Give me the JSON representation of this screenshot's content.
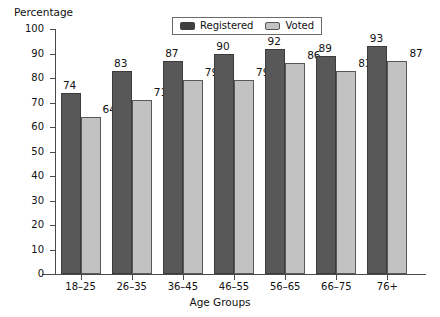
{
  "chart_data": {
    "type": "bar",
    "title": "",
    "xlabel": "Age Groups",
    "ylabel": "Percentage",
    "categories": [
      "18–25",
      "26–35",
      "36–45",
      "46–55",
      "56–65",
      "66–75",
      "76+"
    ],
    "series": [
      {
        "name": "Registered",
        "color": "#585858",
        "values": [
          74,
          83,
          87,
          90,
          92,
          89,
          93
        ]
      },
      {
        "name": "Voted",
        "color": "#c2c2c2",
        "values": [
          64,
          71,
          79,
          79,
          86,
          83,
          87
        ]
      }
    ],
    "ylim": [
      0,
      100
    ],
    "ytick_labels": [
      "100",
      "90",
      "80",
      "70",
      "60",
      "50",
      "40",
      "30",
      "20",
      "10",
      "0"
    ],
    "ytick_values": [
      100,
      90,
      80,
      70,
      60,
      50,
      40,
      30,
      20,
      10,
      0
    ],
    "grid": false,
    "legend_position": "top-center",
    "legend": [
      "Registered",
      "Voted"
    ]
  }
}
